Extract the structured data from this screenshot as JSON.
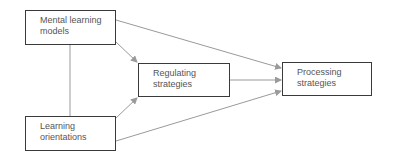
{
  "diagram": {
    "type": "path-model",
    "nodes": [
      {
        "id": "mental",
        "label": "Mental learning\nmodels"
      },
      {
        "id": "orient",
        "label": "Learning\norientations"
      },
      {
        "id": "regul",
        "label": "Regulating\nstrategies"
      },
      {
        "id": "proc",
        "label": "Processing\nstrategies"
      }
    ],
    "edges": [
      {
        "from": "mental",
        "to": "orient",
        "kind": "line"
      },
      {
        "from": "mental",
        "to": "regul",
        "kind": "arrow"
      },
      {
        "from": "mental",
        "to": "proc",
        "kind": "arrow"
      },
      {
        "from": "orient",
        "to": "regul",
        "kind": "arrow"
      },
      {
        "from": "orient",
        "to": "proc",
        "kind": "arrow"
      },
      {
        "from": "regul",
        "to": "proc",
        "kind": "arrow"
      }
    ],
    "colors": {
      "box_border": "#3a3a3a",
      "edge": "#9a9a9a",
      "text": "#555555"
    }
  }
}
